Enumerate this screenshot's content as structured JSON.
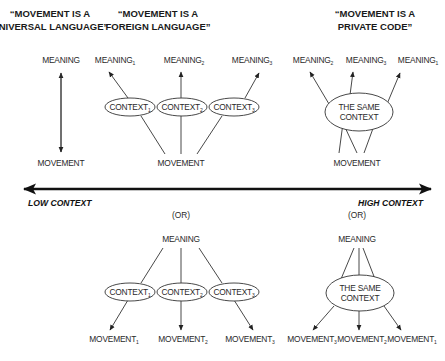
{
  "titles": {
    "universal": {
      "line1": "“MOVEMENT IS A",
      "line2": "UNIVERSAL LANGUAGE”"
    },
    "foreign": {
      "line1": "“MOVEMENT IS A",
      "line2": "FOREIGN LANGUAGE”"
    },
    "private": {
      "line1": "“MOVEMENT IS A",
      "line2": "PRIVATE CODE”"
    }
  },
  "top": {
    "universal": {
      "meaning": "MEANING",
      "movement": "MOVEMENT"
    },
    "foreign": {
      "meanings": [
        {
          "text": "MEANING",
          "sub": "1"
        },
        {
          "text": "MEANING",
          "sub": "2"
        },
        {
          "text": "MEANING",
          "sub": "3"
        }
      ],
      "contexts": [
        {
          "text": "CONTEXT",
          "sub": "1"
        },
        {
          "text": "CONTEXT",
          "sub": "2"
        },
        {
          "text": "CONTEXT",
          "sub": "3"
        }
      ],
      "movement": "MOVEMENT"
    },
    "private": {
      "meanings": [
        {
          "text": "MEANING",
          "sub": "2"
        },
        {
          "text": "MEANING",
          "sub": "3"
        },
        {
          "text": "MEANING",
          "sub": "1"
        }
      ],
      "context_line1": "THE SAME",
      "context_line2": "CONTEXT",
      "movement": "MOVEMENT"
    }
  },
  "axis": {
    "left_label": "LOW CONTEXT",
    "right_label": "HIGH CONTEXT"
  },
  "bottom": {
    "or_label": "(OR)",
    "foreign": {
      "meaning": "MEANING",
      "contexts": [
        {
          "text": "CONTEXT",
          "sub": "1"
        },
        {
          "text": "CONTEXT",
          "sub": "2"
        },
        {
          "text": "CONTEXT",
          "sub": "3"
        }
      ],
      "movements": [
        {
          "text": "MOVEMENT",
          "sub": "1"
        },
        {
          "text": "MOVEMENT",
          "sub": "2"
        },
        {
          "text": "MOVEMENT",
          "sub": "3"
        }
      ]
    },
    "private": {
      "meaning": "MEANING",
      "context_line1": "THE SAME",
      "context_line2": "CONTEXT",
      "movements": [
        {
          "text": "MOVEMENT",
          "sub": "3"
        },
        {
          "text": "MOVEMENT",
          "sub": "2"
        },
        {
          "text": "MOVEMENT",
          "sub": "1"
        }
      ]
    }
  }
}
